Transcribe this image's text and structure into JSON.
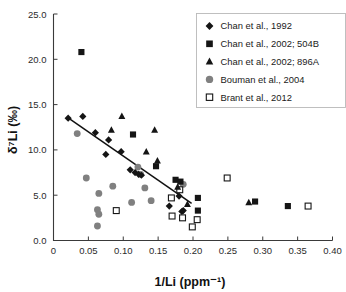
{
  "chart_data": {
    "type": "scatter",
    "title": "",
    "xlabel": "1/Li (ppm⁻¹)",
    "ylabel": "δ⁷Li (‰)",
    "xlim": [
      0,
      0.4
    ],
    "ylim": [
      0.0,
      25.0
    ],
    "xticks": [
      0,
      0.05,
      0.1,
      0.15,
      0.2,
      0.25,
      0.3,
      0.35,
      0.4
    ],
    "xticklabels": [
      "0",
      "0.05",
      "0.10",
      "0.15",
      "0.20",
      "0.25",
      "0.30",
      "0.35",
      "0.40"
    ],
    "yticks": [
      0.0,
      5.0,
      10.0,
      15.0,
      20.0,
      25.0
    ],
    "yticklabels": [
      "0.0",
      "5.0",
      "10.0",
      "15.0",
      "20.0",
      "25.0"
    ],
    "grid": false,
    "legend_position": "top-right",
    "series": [
      {
        "name": "Chan et al., 1992",
        "marker": "diamond",
        "color": "#151515",
        "points": [
          [
            0.021,
            13.5
          ],
          [
            0.042,
            13.7
          ],
          [
            0.06,
            11.9
          ],
          [
            0.075,
            9.5
          ],
          [
            0.079,
            11.1
          ],
          [
            0.097,
            9.8
          ],
          [
            0.11,
            7.8
          ],
          [
            0.117,
            7.5
          ],
          [
            0.122,
            7.3
          ],
          [
            0.126,
            7.2
          ],
          [
            0.166,
            3.8
          ],
          [
            0.18,
            4.9
          ],
          [
            0.184,
            3.2
          ],
          [
            0.186,
            3.3
          ]
        ]
      },
      {
        "name": "Chan et al., 2002; 504B",
        "marker": "square",
        "color": "#151515",
        "points": [
          [
            0.04,
            20.8
          ],
          [
            0.114,
            11.7
          ],
          [
            0.147,
            8.2
          ],
          [
            0.175,
            6.7
          ],
          [
            0.182,
            6.5
          ],
          [
            0.207,
            4.7
          ],
          [
            0.207,
            3.3
          ],
          [
            0.289,
            4.3
          ],
          [
            0.336,
            3.8
          ]
        ]
      },
      {
        "name": "Chan et al., 2002; 896A",
        "marker": "triangle",
        "color": "#151515",
        "points": [
          [
            0.083,
            12.2
          ],
          [
            0.098,
            13.7
          ],
          [
            0.133,
            9.8
          ],
          [
            0.145,
            12.2
          ],
          [
            0.149,
            8.8
          ],
          [
            0.178,
            5.9
          ],
          [
            0.192,
            4.0
          ],
          [
            0.28,
            4.2
          ]
        ]
      },
      {
        "name": "Bouman et al., 2004",
        "marker": "circle",
        "color": "#808080",
        "points": [
          [
            0.034,
            11.8
          ],
          [
            0.047,
            6.9
          ],
          [
            0.065,
            5.2
          ],
          [
            0.063,
            3.4
          ],
          [
            0.065,
            2.9
          ],
          [
            0.063,
            1.6
          ],
          [
            0.085,
            6.0
          ],
          [
            0.112,
            4.2
          ],
          [
            0.121,
            8.1
          ],
          [
            0.125,
            7.3
          ],
          [
            0.131,
            5.8
          ],
          [
            0.14,
            4.4
          ],
          [
            0.186,
            6.2
          ]
        ]
      },
      {
        "name": "Brant et al., 2012",
        "marker": "open-square",
        "color": "#ffffff",
        "points": [
          [
            0.09,
            3.3
          ],
          [
            0.169,
            4.7
          ],
          [
            0.17,
            2.7
          ],
          [
            0.181,
            5.6
          ],
          [
            0.185,
            2.5
          ],
          [
            0.199,
            1.5
          ],
          [
            0.206,
            2.3
          ],
          [
            0.249,
            6.9
          ],
          [
            0.365,
            3.8
          ]
        ]
      }
    ],
    "trendline": {
      "x0": 0.02,
      "y0": 13.6,
      "x1": 0.198,
      "y1": 4.1
    }
  },
  "legend": {
    "items": [
      {
        "label": "Chan et al., 1992",
        "marker": "diamond"
      },
      {
        "label": "Chan et al., 2002; 504B",
        "marker": "square"
      },
      {
        "label": "Chan et al., 2002; 896A",
        "marker": "triangle"
      },
      {
        "label": "Bouman et al., 2004",
        "marker": "circle"
      },
      {
        "label": "Brant et al., 2012",
        "marker": "open-square"
      }
    ]
  }
}
